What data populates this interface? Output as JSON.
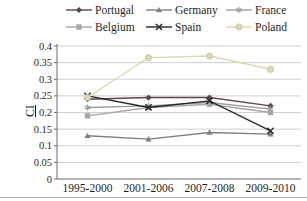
{
  "figure": {
    "y_axis_label": "CI"
  },
  "chart_data": {
    "type": "line",
    "categories": [
      "1995-2000",
      "2001-2006",
      "2007-2008",
      "2009-2010"
    ],
    "series": [
      {
        "name": "Portugal",
        "marker": "diamond",
        "color": "#5e4748",
        "values": [
          0.24,
          0.245,
          0.245,
          0.22
        ]
      },
      {
        "name": "Germany",
        "marker": "triangle",
        "color": "#7f7f7f",
        "values": [
          0.13,
          0.12,
          0.14,
          0.135
        ]
      },
      {
        "name": "France",
        "marker": "asterisk",
        "color": "#9c9c9c",
        "values": [
          0.215,
          0.22,
          0.23,
          0.21
        ]
      },
      {
        "name": "Belgium",
        "marker": "square",
        "color": "#a6a6a6",
        "values": [
          0.19,
          0.215,
          0.225,
          0.2
        ]
      },
      {
        "name": "Spain",
        "marker": "x",
        "color": "#262626",
        "values": [
          0.25,
          0.215,
          0.235,
          0.145
        ]
      },
      {
        "name": "Poland",
        "marker": "circle",
        "color": "#dcd7b4",
        "values": [
          0.245,
          0.365,
          0.37,
          0.33
        ]
      }
    ],
    "ylabel": "CI",
    "ylim": [
      0,
      0.4
    ],
    "ytick_labels": [
      "0",
      "0.05",
      "0.1",
      "0.15",
      "0.2",
      "0.25",
      "0.3",
      "0.35",
      "0.4"
    ],
    "grid": true,
    "legend_position": "top",
    "legend_rows": [
      [
        "Portugal",
        "Germany",
        "France"
      ],
      [
        "Belgium",
        "Spain",
        "Poland"
      ]
    ]
  }
}
